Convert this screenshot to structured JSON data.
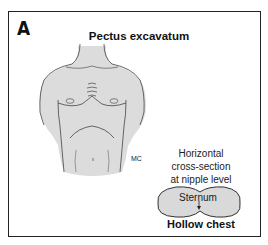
{
  "figure": {
    "panel_label": "A",
    "title": "Pectus excavatum",
    "artist_initials": "MC",
    "cross_section_label": [
      "Horizontal",
      "cross-section",
      "at nipple level"
    ],
    "sternum_label": "Sternum",
    "caption": "Hollow chest",
    "colors": {
      "skin_fill": "#d9d9d9",
      "outline": "#333333",
      "frame": "#222222"
    }
  }
}
